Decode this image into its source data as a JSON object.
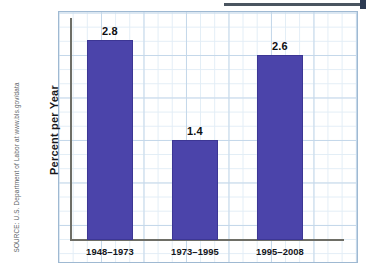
{
  "source_note": "SOURCE: U.S. Department of Labor at www.bls.gov/data",
  "colors": {
    "bar": "#4b44aa",
    "grid_minor": "#e2edf6",
    "grid_major": "#c5d8ea",
    "axis": "#6e6e66",
    "text": "#14151a"
  },
  "chart_data": {
    "type": "bar",
    "title": "",
    "xlabel": "",
    "ylabel": "Percent per Year",
    "categories": [
      "1948–1973",
      "1973–1995",
      "1995–2008"
    ],
    "values": [
      2.8,
      1.4,
      2.6
    ],
    "value_labels": [
      "2.8",
      "1.4",
      "2.6"
    ],
    "ylim": [
      0,
      3.1
    ],
    "y_tick_labels": [],
    "grid": true,
    "legend": null,
    "legend_position": "none",
    "series": [
      {
        "name": "Productivity growth",
        "values": [
          2.8,
          1.4,
          2.6
        ]
      }
    ],
    "annotations": []
  }
}
